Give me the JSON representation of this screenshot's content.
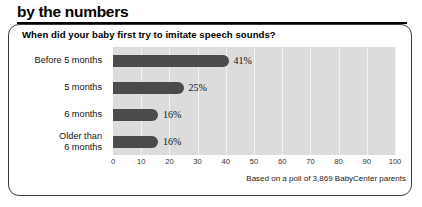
{
  "header": {
    "title": "by the numbers"
  },
  "card": {
    "question": "When did your baby first try to imitate speech sounds?",
    "footer_note": "Based on a poll of 3,869 BabyCenter parents"
  },
  "chart_data": {
    "type": "bar",
    "orientation": "horizontal",
    "title": "When did your baby first try to imitate speech sounds?",
    "categories": [
      "Before 5 months",
      "5 months",
      "6 months",
      "Older than\n6 months"
    ],
    "category_labels": [
      {
        "line1": "Before 5 months",
        "line2": ""
      },
      {
        "line1": "5 months",
        "line2": ""
      },
      {
        "line1": "6 months",
        "line2": ""
      },
      {
        "line1": "Older than",
        "line2": "6 months"
      }
    ],
    "values": [
      41,
      25,
      16,
      16
    ],
    "value_labels": [
      "41%",
      "25%",
      "16%",
      "16%"
    ],
    "xlabel": "",
    "ylabel": "",
    "xlim": [
      0,
      100
    ],
    "xticks": [
      0,
      10,
      20,
      30,
      40,
      50,
      60,
      70,
      80,
      90,
      100
    ],
    "xtick_labels": [
      "0",
      "10",
      "20",
      "30",
      "40",
      "50",
      "60",
      "70",
      "80",
      "90",
      "100"
    ],
    "grid": true,
    "grid_axis": "x",
    "legend": false,
    "annotation": "Based on a poll of 3,869 BabyCenter parents",
    "colors": {
      "bar": "#4b4b4b",
      "plot_background": "#dcdcdc",
      "gridline": "#f2f2f2",
      "text": "#111111",
      "card_border": "#3b3b3b",
      "rule": "#000000"
    }
  }
}
